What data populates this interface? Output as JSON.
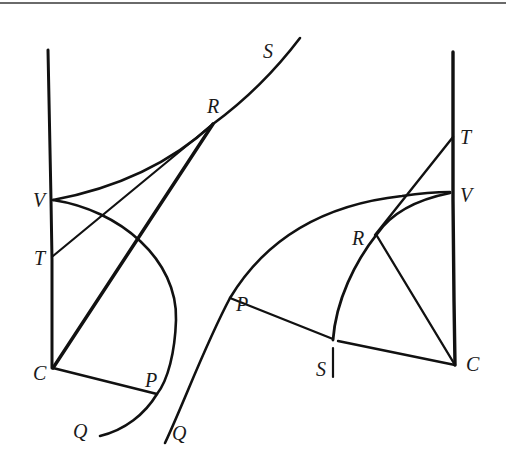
{
  "diagram": {
    "type": "geometric-construction",
    "colors": {
      "ink": "#111111",
      "background": "#ffffff",
      "top_rule": "#6a6a6a"
    },
    "left_figure": {
      "labels": {
        "V": "V",
        "T": "T",
        "C": "C",
        "R": "R",
        "S": "S",
        "P": "P",
        "Q": "Q"
      }
    },
    "right_figure": {
      "labels": {
        "T": "T",
        "V": "V",
        "R": "R",
        "P": "P",
        "S": "S",
        "C": "C",
        "Q": "Q"
      }
    }
  }
}
